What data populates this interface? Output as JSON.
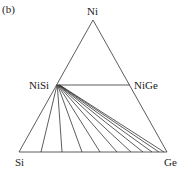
{
  "panel_label": "(b)",
  "vertices": {
    "top": "Ni",
    "left": "Si",
    "right": "Ge"
  },
  "phases": {
    "left": "NiSi",
    "right": "NiGe"
  },
  "diagram": {
    "type": "ternary phase diagram",
    "apex": [
      93,
      20
    ],
    "base_left": [
      19,
      152
    ],
    "base_right": [
      167,
      152
    ],
    "nisi_point": [
      56,
      85
    ],
    "nige_point": [
      130,
      85
    ],
    "tie_line_base_x": [
      41,
      62,
      82,
      100,
      117,
      131,
      143,
      152,
      159,
      164
    ],
    "line_color": "#333333"
  }
}
